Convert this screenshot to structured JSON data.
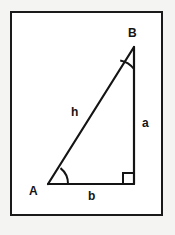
{
  "figure": {
    "type": "right-triangle-diagram",
    "frame": {
      "border_color": "#1a1a1a",
      "fill_color": "#ffffff",
      "x": 10,
      "y": 11,
      "width": 153,
      "height": 205
    },
    "page_background": "#f4f4f2",
    "stroke_color": "#141414",
    "vertices": [
      {
        "name": "A",
        "label": "A",
        "x": 48,
        "y": 184,
        "angle_marker": "arc"
      },
      {
        "name": "B",
        "label": "B",
        "x": 134,
        "y": 47,
        "angle_marker": "arc"
      },
      {
        "name": "C",
        "label": "",
        "x": 134,
        "y": 184,
        "angle_marker": "right-angle-square"
      }
    ],
    "sides": [
      {
        "name": "hypotenuse",
        "label": "h",
        "from": "A",
        "to": "B",
        "label_x": 76,
        "label_y": 112
      },
      {
        "name": "opposite",
        "label": "a",
        "from": "B",
        "to": "C",
        "label_x": 146,
        "label_y": 123
      },
      {
        "name": "adjacent",
        "label": "b",
        "from": "A",
        "to": "C",
        "label_x": 92,
        "label_y": 195
      }
    ],
    "labels": {
      "vertex_b": "B",
      "vertex_a": "A",
      "side_h": "h",
      "side_a": "a",
      "side_b": "b"
    }
  }
}
